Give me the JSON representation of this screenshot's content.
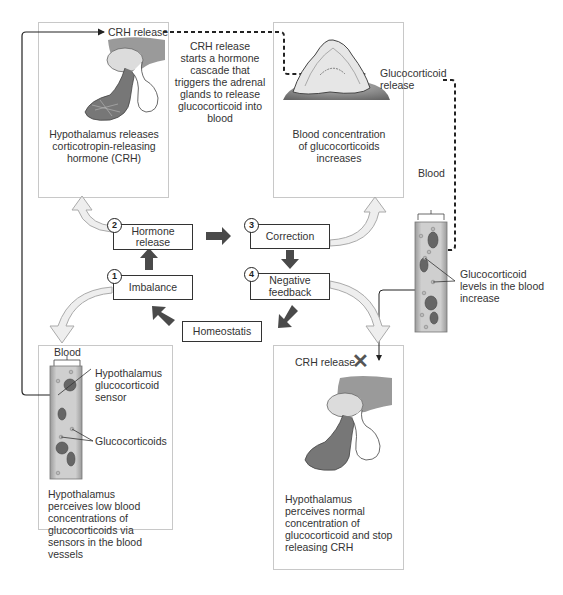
{
  "colors": {
    "block_arrow": "#4a4a4a",
    "curved_arrow_fill": "#eeeeee",
    "curved_arrow_stroke": "#aaaaaa",
    "panel_border": "#c8c8c8",
    "line": "#222222"
  },
  "panels": {
    "top_left": {
      "label_top": "CRH release",
      "caption": [
        "Hypothalamus releases",
        "corticotropin-releasing",
        "hormone (CRH)"
      ]
    },
    "cascade_note": [
      "CRH release",
      "starts a hormone",
      "cascade that",
      "triggers the adrenal",
      "glands to release",
      "glucocorticoid into",
      "blood"
    ],
    "top_right": {
      "side_label": [
        "Glucocorticoid",
        "release"
      ],
      "caption": [
        "Blood concentration",
        "of glucocorticoids",
        "increases"
      ]
    },
    "right_vessel": {
      "blood_label": "Blood",
      "annotation": [
        "Glucocorticoid",
        "levels in the blood",
        "increase"
      ]
    },
    "bottom_left": {
      "blood_label": "Blood",
      "sensor_label": [
        "Hypothalamus",
        "glucocorticoid",
        "sensor"
      ],
      "glucocorticoids_label": "Glucocorticoids",
      "caption": [
        "Hypothalamus",
        "perceives low blood",
        "concentrations of",
        "glucocorticoids via",
        "sensors in the blood",
        "vessels"
      ]
    },
    "bottom_right": {
      "label_top": "CRH release",
      "x_icon": "✕",
      "caption": [
        "Hypothalamus",
        "perceives normal",
        "concentration of",
        "glucocorticoid and stop",
        "releasing CRH"
      ]
    }
  },
  "cycle": {
    "steps": [
      {
        "num": "1",
        "label": "Imbalance"
      },
      {
        "num": "2",
        "label": "Hormone release"
      },
      {
        "num": "3",
        "label": "Correction"
      },
      {
        "num": "4",
        "label": "Negative feedback"
      }
    ],
    "center": "Homeostatis"
  }
}
